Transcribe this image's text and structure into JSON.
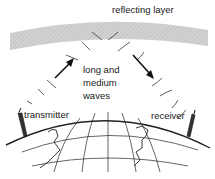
{
  "diagram": {
    "labels": {
      "reflecting_layer": "reflecting layer",
      "waves_line1": "long and",
      "waves_line2": "medium",
      "waves_line3": "waves",
      "transmitter": "transmitter",
      "receiver": "receiver"
    },
    "colors": {
      "layer": "#c8c8c8",
      "ink": "#222222",
      "background": "#ffffff"
    }
  }
}
